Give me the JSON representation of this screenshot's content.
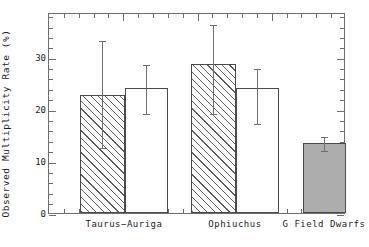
{
  "chart_data": {
    "type": "bar",
    "title": "",
    "subtitle": "",
    "xlabel": "",
    "ylabel": "Observed Multiplicity Rate (%)",
    "ylim": [
      0,
      38.7
    ],
    "xlim": [
      0,
      1
    ],
    "grid": false,
    "legend": null,
    "y_ticks_major": [
      0,
      10,
      20,
      30
    ],
    "y_tick_labels": [
      "0",
      "10",
      "20",
      "30"
    ],
    "y_minor_tick_step": 2,
    "categories": [
      "Taurus−Auriga",
      "Ophiuchus",
      "G Field Dwarfs"
    ],
    "series": [
      {
        "name": "hatched",
        "style": "hatched",
        "values": [
          22.8,
          28.7,
          null
        ],
        "err_low": [
          12.7,
          19.2,
          null
        ],
        "err_high": [
          33.5,
          36.5,
          null
        ]
      },
      {
        "name": "open",
        "style": "white",
        "values": [
          24.1,
          24.1,
          null
        ],
        "err_low": [
          19.3,
          17.3,
          null
        ],
        "err_high": [
          28.9,
          28.1,
          null
        ]
      },
      {
        "name": "filled",
        "style": "gray",
        "values": [
          null,
          null,
          13.5
        ],
        "err_low": [
          null,
          null,
          12.1
        ],
        "err_high": [
          null,
          null,
          15.0
        ]
      }
    ],
    "bars": [
      {
        "id": "taurus-hatched",
        "category": "Taurus−Auriga",
        "style": "hatched",
        "value": 22.8,
        "err_low": 12.7,
        "err_high": 33.5,
        "x_px": 79,
        "w_px": 45
      },
      {
        "id": "taurus-open",
        "category": "Taurus−Auriga",
        "style": "white",
        "value": 24.1,
        "err_low": 19.3,
        "err_high": 28.9,
        "x_px": 124,
        "w_px": 43
      },
      {
        "id": "ophiuchus-hatched",
        "category": "Ophiuchus",
        "style": "hatched",
        "value": 28.7,
        "err_low": 19.2,
        "err_high": 36.5,
        "x_px": 190,
        "w_px": 45
      },
      {
        "id": "ophiuchus-open",
        "category": "Ophiuchus",
        "style": "white",
        "value": 24.1,
        "err_low": 17.3,
        "err_high": 28.1,
        "x_px": 235,
        "w_px": 43
      },
      {
        "id": "gfield-filled",
        "category": "G Field Dwarfs",
        "style": "gray",
        "value": 13.5,
        "err_low": 12.1,
        "err_high": 15.0,
        "x_px": 302,
        "w_px": 43
      }
    ],
    "x_label_positions_px": [
      124,
      235,
      324
    ],
    "colors": {
      "axis": "#6e6e6e",
      "bar_edge": "#4a4a4a",
      "hatch": "#5a5a5a",
      "gray_fill": "#adadad",
      "text": "#1a1a1a",
      "background": "#ffffff"
    }
  },
  "axis": {
    "y_title": "Observed Multiplicity Rate (%)"
  }
}
